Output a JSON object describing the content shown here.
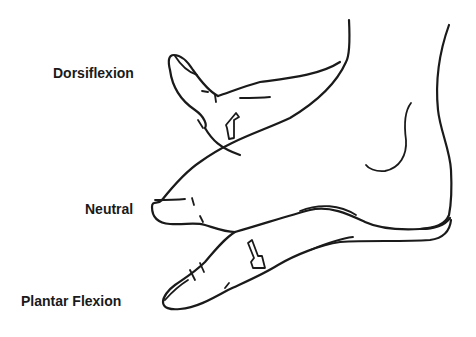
{
  "figure": {
    "type": "line-art illustration",
    "labels": {
      "dorsiflexion": "Dorsiflexion",
      "neutral": "Neutral",
      "plantar_flexion": "Plantar Flexion"
    },
    "positions": [
      "Dorsiflexion",
      "Neutral",
      "Plantar Flexion"
    ],
    "icons": {
      "dorsiflexion_arrow": "arrow-up-icon",
      "plantar_arrow": "arrow-down-icon"
    },
    "colors": {
      "line": "#1a1a1a",
      "background": "#ffffff"
    }
  }
}
